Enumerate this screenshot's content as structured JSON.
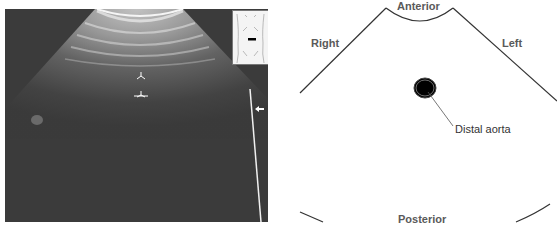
{
  "figure": {
    "left_panel": {
      "type": "ultrasound-image",
      "description": "Transverse sonogram of distal abdominal aorta",
      "markers": [
        {
          "name": "caliper-top",
          "glyph": "Y-shaped caret"
        },
        {
          "name": "caliper-bottom",
          "glyph": "Y-shaped caret"
        },
        {
          "name": "arrow",
          "glyph": "←"
        }
      ],
      "inset": {
        "name": "body-marker",
        "description": "Torso outline with transverse probe marker"
      }
    },
    "right_panel": {
      "type": "line-drawing",
      "labels": {
        "anterior": "Anterior",
        "posterior": "Posterior",
        "right": "Right",
        "left": "Left"
      },
      "callouts": {
        "aorta": "Distal aorta"
      }
    },
    "colors": {
      "ultrasound_bg": "#3a3a3a",
      "label_text": "#5a5a5a",
      "line": "#333333",
      "aorta_fill": "#000000"
    }
  }
}
